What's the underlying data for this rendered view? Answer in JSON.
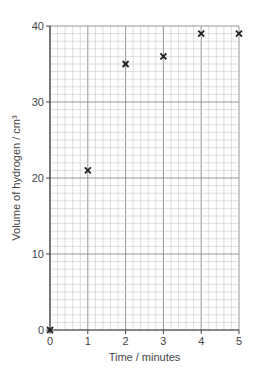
{
  "chart_data": {
    "type": "scatter",
    "title": "",
    "xlabel": "Time / minutes",
    "ylabel": "Volume of hydrogen / cm³",
    "xlim": [
      0,
      5
    ],
    "ylim": [
      0,
      40
    ],
    "xticks": [
      "0",
      "1",
      "2",
      "3",
      "4",
      "5"
    ],
    "yticks": [
      "0",
      "10",
      "20",
      "30",
      "40"
    ],
    "grid": true,
    "marker": "x",
    "series": [
      {
        "name": "hydrogen volume",
        "x": [
          0,
          1,
          2,
          3,
          4,
          5
        ],
        "y": [
          0,
          21,
          35,
          36,
          39,
          39
        ]
      }
    ],
    "colors": {
      "grid_minor": "#c8c8c8",
      "grid_major": "#8a8a8a",
      "axis": "#444444",
      "marker": "#222222"
    }
  }
}
